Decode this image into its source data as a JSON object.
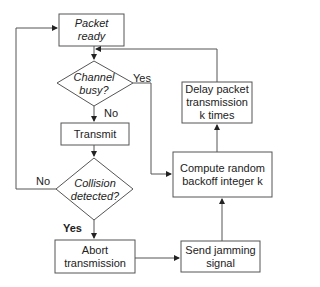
{
  "diagram": {
    "type": "flowchart",
    "nodes": {
      "packet_ready": "Packet ready",
      "packet_ready_l1": "Packet",
      "packet_ready_l2": "ready",
      "channel_busy_l1": "Channel",
      "channel_busy_l2": "busy?",
      "transmit": "Transmit",
      "collision_l1": "Collision",
      "collision_l2": "detected?",
      "abort_l1": "Abort",
      "abort_l2": "transmission",
      "jamming_l1": "Send jamming",
      "jamming_l2": "signal",
      "compute_l1": "Compute random",
      "compute_l2": "backoff integer k",
      "delay_l1": "Delay packet",
      "delay_l2": "transmission",
      "delay_l3": "k times"
    },
    "edge_labels": {
      "channel_yes": "Yes",
      "channel_no": "No",
      "collision_no": "No",
      "collision_yes": "Yes"
    },
    "colors": {
      "stroke": "#555555",
      "text": "#222222",
      "background": "#ffffff"
    }
  }
}
